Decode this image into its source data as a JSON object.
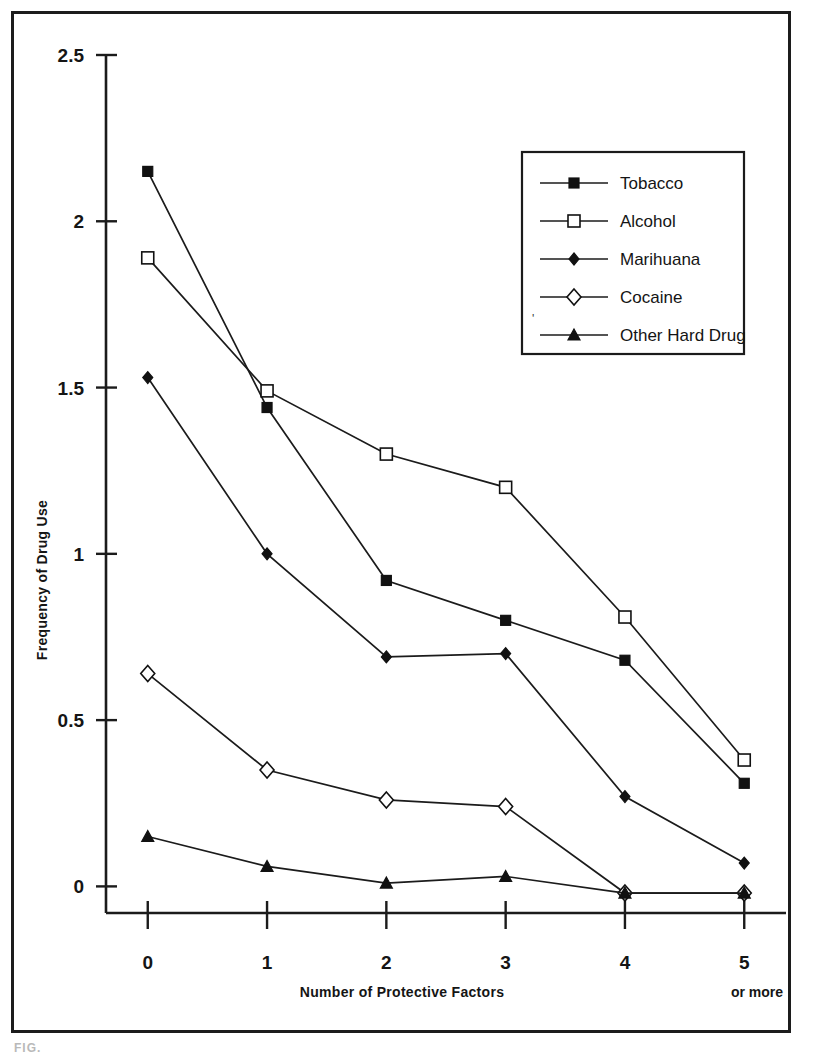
{
  "figure": {
    "caption_stub": "FIG."
  },
  "chart_data": {
    "type": "line",
    "title": "",
    "xlabel": "Number of Protective Factors",
    "ylabel": "Frequency of Drug Use",
    "x_tick_sublabel": "or more",
    "categories": [
      "0",
      "1",
      "2",
      "3",
      "4",
      "5"
    ],
    "x_values": [
      0,
      1,
      2,
      3,
      4,
      5
    ],
    "xlim": [
      -0.35,
      5.35
    ],
    "ylim": [
      -0.08,
      2.5
    ],
    "y_ticks": [
      "0",
      "0.5",
      "1",
      "1.5",
      "2",
      "2.5"
    ],
    "y_tick_values": [
      0,
      0.5,
      1,
      1.5,
      2,
      2.5
    ],
    "grid": false,
    "legend_position": "upper-right",
    "series": [
      {
        "name": "Tobacco",
        "marker": "filled-square",
        "values": [
          2.15,
          1.44,
          0.92,
          0.8,
          0.68,
          0.31
        ]
      },
      {
        "name": "Alcohol",
        "marker": "open-square",
        "values": [
          1.89,
          1.49,
          1.3,
          1.2,
          0.81,
          0.38
        ]
      },
      {
        "name": "Marihuana",
        "marker": "filled-diamond",
        "values": [
          1.53,
          1.0,
          0.69,
          0.7,
          0.27,
          0.07
        ]
      },
      {
        "name": "Cocaine",
        "marker": "open-diamond",
        "values": [
          0.64,
          0.35,
          0.26,
          0.24,
          -0.02,
          -0.02
        ]
      },
      {
        "name": "Other Hard Drug",
        "marker": "filled-triangle",
        "values": [
          0.15,
          0.06,
          0.01,
          0.03,
          -0.02,
          -0.02
        ]
      }
    ],
    "legend_stray_mark": "'",
    "line_color": "#1b1b1b",
    "background": "#ffffff"
  }
}
